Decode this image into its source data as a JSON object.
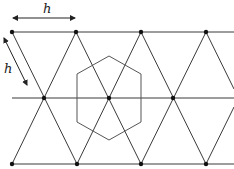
{
  "diagram": {
    "labels": {
      "horizontal_spacing": "h",
      "diagonal_spacing": "h"
    },
    "colors": {
      "lattice_line": "#3a3a3a",
      "hexagon_line": "#555555",
      "node": "#111111",
      "arrow": "#222222"
    },
    "rows": [
      {
        "name": "top",
        "y": 32,
        "nodes_x": [
          12,
          76,
          141,
          206
        ]
      },
      {
        "name": "middle",
        "y": 98,
        "nodes_x": [
          44,
          109,
          173
        ]
      },
      {
        "name": "bottom",
        "y": 164,
        "nodes_x": [
          12,
          77,
          141,
          206
        ]
      }
    ],
    "hexagon": {
      "cx": 109,
      "cy": 98,
      "radius": 42
    }
  }
}
